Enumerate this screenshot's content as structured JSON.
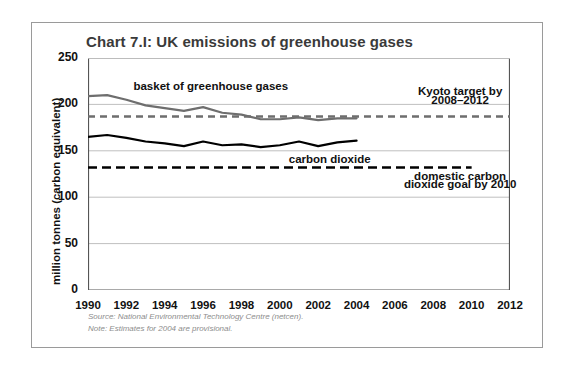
{
  "chart_data": {
    "type": "line",
    "title": "Chart 7.I: UK emissions of greenhouse gases",
    "xlabel": "",
    "ylabel": "million tonnes (carbon equivalent)",
    "xlim": [
      1990,
      2012
    ],
    "ylim": [
      0,
      250
    ],
    "yticks": [
      0,
      50,
      100,
      150,
      200,
      250
    ],
    "xticks": [
      1990,
      1991,
      1992,
      1993,
      1994,
      1995,
      1996,
      1997,
      1998,
      1999,
      2000,
      2001,
      2002,
      2003,
      2004,
      2005,
      2006,
      2007,
      2008,
      2009,
      2010,
      2011,
      2012
    ],
    "xtick_labels": [
      "1990",
      "1992",
      "1994",
      "1996",
      "1998",
      "2000",
      "2002",
      "2004",
      "2006",
      "2008",
      "2010",
      "2012"
    ],
    "grid": "horizontal",
    "legend": "annotations-inline",
    "series": [
      {
        "name": "basket of greenhouse gases",
        "style": "solid",
        "color": "#6e6e6e",
        "x": [
          1990,
          1991,
          1992,
          1993,
          1994,
          1995,
          1996,
          1997,
          1998,
          1999,
          2000,
          2001,
          2002,
          2003,
          2004
        ],
        "values": [
          209,
          210,
          205,
          199,
          196,
          193,
          197,
          191,
          189,
          184,
          184,
          186,
          183,
          185,
          185
        ]
      },
      {
        "name": "carbon dioxide",
        "style": "solid",
        "color": "#000000",
        "x": [
          1990,
          1991,
          1992,
          1993,
          1994,
          1995,
          1996,
          1997,
          1998,
          1999,
          2000,
          2001,
          2002,
          2003,
          2004
        ],
        "values": [
          165,
          167,
          164,
          160,
          158,
          155,
          160,
          156,
          157,
          154,
          156,
          160,
          155,
          159,
          161
        ]
      },
      {
        "name": "Kyoto target by 2008–2012",
        "style": "dashed",
        "color": "#6e6e6e",
        "x": [
          1990,
          2012
        ],
        "values": [
          187,
          187
        ]
      },
      {
        "name": "domestic carbon dioxide goal by 2010",
        "style": "dashed",
        "color": "#000000",
        "x": [
          1990,
          2010
        ],
        "values": [
          132,
          132
        ]
      }
    ],
    "annotations": [
      {
        "text": "basket of greenhouse gases",
        "x": 1996.4,
        "y": 219
      },
      {
        "text": "Kyoto target by",
        "x": 2009.4,
        "y": 213
      },
      {
        "text": "2008–2012",
        "x": 2009.4,
        "y": 204
      },
      {
        "text": "carbon dioxide",
        "x": 2002.6,
        "y": 140
      },
      {
        "text": "domestic carbon",
        "x": 2009.4,
        "y": 122
      },
      {
        "text": "dioxide goal by 2010",
        "x": 2009.4,
        "y": 113
      }
    ]
  },
  "footnotes": {
    "source": "Source: National Environmental Technology Centre (netcen).",
    "note": "Note: Estimates for 2004 are provisional."
  },
  "colors": {
    "basket_line": "#6e6e6e",
    "co2_line": "#000000",
    "gridline": "#b8b8b8",
    "axis": "#555555",
    "border": "#9a9a9a",
    "title": "#3a3a3a",
    "footnote": "#8d8d8d"
  }
}
